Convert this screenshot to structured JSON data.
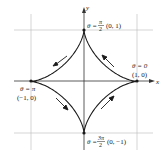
{
  "diagram": {
    "axes": {
      "x_label": "x",
      "y_label": "y"
    },
    "points": [
      {
        "id": "top",
        "theta_label": "θ = ",
        "theta_num": "π",
        "theta_den": "2",
        "coord": "(0, 1)"
      },
      {
        "id": "right",
        "theta_label": "θ = 0",
        "coord": "(1, 0)"
      },
      {
        "id": "left",
        "theta_label": "θ = π",
        "coord": "(−1, 0)"
      },
      {
        "id": "bottom",
        "theta_label": "θ = ",
        "theta_num": "3π",
        "theta_den": "2",
        "coord": "(0, −1)"
      }
    ],
    "direction": "counterclockwise",
    "colors": {
      "curve": "#1a1a1a",
      "grid": "#b0b0b0",
      "axis": "#333333"
    }
  }
}
